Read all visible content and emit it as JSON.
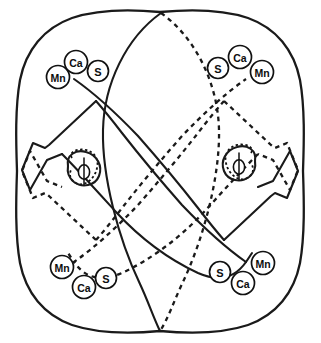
{
  "figure": {
    "background_color": "#ffffff",
    "line_color": "#1a1a1a",
    "width": 321,
    "height": 343
  },
  "legend_markers": {
    "calcium_label": "Ca",
    "manganese_label": "Mn",
    "sulfur_label": "S",
    "phi_label": "ϕ"
  },
  "ion_clusters": [
    {
      "id": "top-left",
      "quadrant": "top-left",
      "markers": [
        {
          "label": "Mn",
          "cx": 58,
          "cy": 77,
          "r": 11.5,
          "font_size": 10.5
        },
        {
          "label": "Ca",
          "cx": 76,
          "cy": 62,
          "r": 11.5,
          "font_size": 10.5
        },
        {
          "label": "S",
          "cx": 98,
          "cy": 71,
          "r": 10.5,
          "font_size": 11
        }
      ]
    },
    {
      "id": "top-right",
      "quadrant": "top-right",
      "markers": [
        {
          "label": "S",
          "cx": 218,
          "cy": 68,
          "r": 10.5,
          "font_size": 11
        },
        {
          "label": "Ca",
          "cx": 240,
          "cy": 57,
          "r": 11.5,
          "font_size": 10.5
        },
        {
          "label": "Mn",
          "cx": 262,
          "cy": 72,
          "r": 11.5,
          "font_size": 10.5
        }
      ]
    },
    {
      "id": "bottom-left",
      "quadrant": "bottom-left",
      "markers": [
        {
          "label": "Mn",
          "cx": 62,
          "cy": 267,
          "r": 11.5,
          "font_size": 10.5
        },
        {
          "label": "Ca",
          "cx": 84,
          "cy": 287,
          "r": 11.5,
          "font_size": 10.5
        },
        {
          "label": "S",
          "cx": 106,
          "cy": 278,
          "r": 10.5,
          "font_size": 11
        }
      ]
    },
    {
      "id": "bottom-right",
      "quadrant": "bottom-right",
      "markers": [
        {
          "label": "S",
          "cx": 220,
          "cy": 272,
          "r": 10.5,
          "font_size": 11
        },
        {
          "label": "Ca",
          "cx": 243,
          "cy": 283,
          "r": 11.5,
          "font_size": 10.5
        },
        {
          "label": "Mn",
          "cx": 263,
          "cy": 263,
          "r": 11.5,
          "font_size": 10.5
        }
      ]
    }
  ],
  "phi_markers": [
    {
      "id": "phi-left",
      "label": "ϕ",
      "cx": 84,
      "cy": 172,
      "rx": 5.5,
      "ry": 7.0
    },
    {
      "id": "phi-right",
      "label": "ϕ",
      "cx": 239,
      "cy": 167,
      "rx": 5.5,
      "ry": 7.0
    }
  ],
  "paths": {
    "outer_boundary": "M 160 13 C 104 9 52 21 30 50 C 8 80 13 126 16 171 C 13 216 8 262 30 292 C 52 322 104 334 160 330 C 216 334 268 322 290 292 C 312 262 307 216 304 171 C 307 126 312 80 290 50 C 268 21 216 9 160 13 Z",
    "oval_left_solid": "M 160 13 C 120 40 100 95 102 145 C 104 200 128 268 160 330",
    "oval_right_dashed": "M 160 13 C 200 40 220 95 218 145 C 216 200 192 268 160 330",
    "band_tl_outer": "M 100 86 L 72 127 L 52 142 L 28 170 L 31 196",
    "band_topleft_solid": "M 97 85 L 66 125 L 44 140 L 24 168 L 31 191 L 45 158 L 60 150 L 96 198 L 139 243 L 175 278 L 212 303",
    "band_bottomright_solid": "M 223 257 L 254 217 L 276 202 L 296 174 L 289 151 L 275 184 L 260 192 L 224 144 L 181 99 L 145 64 L 108 39",
    "band_topright_dashed": "M 223 85 L 254 125 L 276 140 L 296 168 L 289 191 L 275 158 L 260 150 L 224 198 L 181 243 L 145 278 L 108 303",
    "band_bottomleft_dashed": "M 97 257 L 66 217 L 44 202 L 24 174 L 31 151 L 45 184 L 60 192 L 96 144 L 139 99 L 175 64 L 212 39"
  }
}
